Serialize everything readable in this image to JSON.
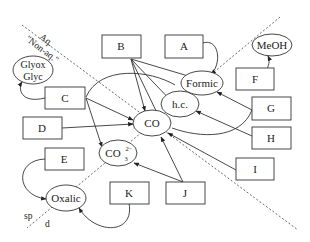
{
  "regions": {
    "aq_label": "Aq.",
    "nonaq_label": "\"Non-aq.\"",
    "sp_label": "sp",
    "d_label": "d"
  },
  "species": {
    "glyox": "Glyox",
    "glyc": "Glyc",
    "meoh": "MeOH",
    "formic": "Formic",
    "hc": "h.c.",
    "co": "CO",
    "co3": "CO",
    "co3_sup": "2−",
    "co3_sub": "3",
    "oxalic": "Oxalic"
  },
  "boxes": {
    "A": "A",
    "B": "B",
    "C": "C",
    "D": "D",
    "E": "E",
    "F": "F",
    "G": "G",
    "H": "H",
    "I": "I",
    "J": "J",
    "K": "K"
  }
}
